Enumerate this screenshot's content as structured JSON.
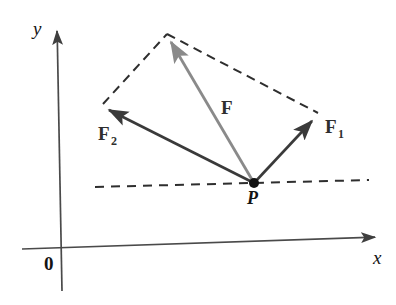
{
  "figure": {
    "background_color": "#ffffff"
  },
  "axes": {
    "x_label": "x",
    "y_label": "y",
    "origin_label": "0",
    "axis_color": "#4a4a4a",
    "x_axis": {
      "x1": 22,
      "y1": 249,
      "x2": 381,
      "y2": 237
    },
    "y_axis": {
      "x1": 57,
      "y1": 28,
      "x2": 62,
      "y2": 291
    },
    "x_label_pos": {
      "x": 373,
      "y": 264
    },
    "y_label_pos": {
      "x": 33,
      "y": 35
    },
    "origin_label_pos": {
      "x": 44,
      "y": 270
    }
  },
  "points": [
    {
      "name": "P",
      "label": "P",
      "x": 254,
      "y": 183,
      "label_pos": {
        "x": 247,
        "y": 204
      },
      "dot_radius": 5,
      "color": "#111111"
    }
  ],
  "vectors": [
    {
      "name": "F1",
      "label": "F",
      "subscript": "1",
      "color": "#3a3a3a",
      "from": {
        "x": 254,
        "y": 183
      },
      "to": {
        "x": 314,
        "y": 119
      },
      "label_pos": {
        "x": 325,
        "y": 133
      },
      "subscript_pos": {
        "x": 338,
        "y": 138
      }
    },
    {
      "name": "F2",
      "label": "F",
      "subscript": "2",
      "color": "#3a3a3a",
      "from": {
        "x": 254,
        "y": 183
      },
      "to": {
        "x": 105,
        "y": 108
      },
      "label_pos": {
        "x": 98,
        "y": 140
      },
      "subscript_pos": {
        "x": 112,
        "y": 145
      }
    },
    {
      "name": "F",
      "label": "F",
      "subscript": "",
      "color": "#8a8a8a",
      "from": {
        "x": 254,
        "y": 183
      },
      "to": {
        "x": 169,
        "y": 39
      },
      "label_pos": {
        "x": 221,
        "y": 114
      },
      "subscript_pos": null
    }
  ],
  "dashed_lines": [
    {
      "name": "parallelogram-edge-left",
      "from": {
        "x": 103,
        "y": 104
      },
      "to": {
        "x": 167,
        "y": 34
      },
      "color": "#2e2e2e"
    },
    {
      "name": "parallelogram-edge-right",
      "from": {
        "x": 167,
        "y": 34
      },
      "to": {
        "x": 318,
        "y": 113
      },
      "color": "#2e2e2e"
    },
    {
      "name": "horizontal-reference-line",
      "from": {
        "x": 95,
        "y": 187
      },
      "to": {
        "x": 369,
        "y": 180
      },
      "color": "#2e2e2e"
    }
  ],
  "colors": {
    "resultant": "#8a8a8a",
    "component": "#3a3a3a",
    "dashed": "#2e2e2e",
    "axis": "#4a4a4a",
    "text": "#141414"
  }
}
